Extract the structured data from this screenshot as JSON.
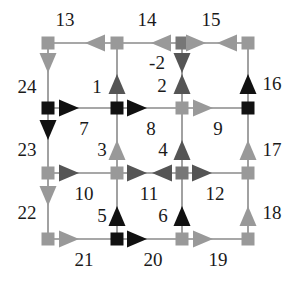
{
  "colors": {
    "background": "#ffffff",
    "edge_line": "#8a8a8a",
    "black": "#111111",
    "dark_gray": "#555555",
    "mid_gray": "#777777",
    "light_gray": "#999999",
    "label": "#1a1a1a"
  },
  "nodes": [
    {
      "id": "n00",
      "x": 48,
      "y": 43,
      "color": "light_gray"
    },
    {
      "id": "n10",
      "x": 117,
      "y": 43,
      "color": "light_gray"
    },
    {
      "id": "n20",
      "x": 182,
      "y": 43,
      "color": "mid_gray"
    },
    {
      "id": "n30",
      "x": 248,
      "y": 43,
      "color": "light_gray"
    },
    {
      "id": "n01",
      "x": 48,
      "y": 108,
      "color": "black"
    },
    {
      "id": "n11",
      "x": 117,
      "y": 108,
      "color": "black"
    },
    {
      "id": "n21",
      "x": 182,
      "y": 108,
      "color": "light_gray"
    },
    {
      "id": "n31",
      "x": 248,
      "y": 108,
      "color": "black"
    },
    {
      "id": "n02",
      "x": 48,
      "y": 173,
      "color": "light_gray"
    },
    {
      "id": "n12",
      "x": 117,
      "y": 173,
      "color": "light_gray"
    },
    {
      "id": "n22",
      "x": 182,
      "y": 173,
      "color": "mid_gray"
    },
    {
      "id": "n32",
      "x": 248,
      "y": 173,
      "color": "light_gray"
    },
    {
      "id": "n03",
      "x": 48,
      "y": 239,
      "color": "light_gray"
    },
    {
      "id": "n13",
      "x": 117,
      "y": 239,
      "color": "black"
    },
    {
      "id": "n23",
      "x": 182,
      "y": 239,
      "color": "light_gray"
    },
    {
      "id": "n33",
      "x": 248,
      "y": 239,
      "color": "light_gray"
    }
  ],
  "edges": [
    {
      "x1": 48,
      "y1": 43,
      "x2": 248,
      "y2": 43
    },
    {
      "x1": 48,
      "y1": 108,
      "x2": 248,
      "y2": 108
    },
    {
      "x1": 48,
      "y1": 173,
      "x2": 248,
      "y2": 173
    },
    {
      "x1": 48,
      "y1": 239,
      "x2": 248,
      "y2": 239
    },
    {
      "x1": 48,
      "y1": 43,
      "x2": 48,
      "y2": 239
    },
    {
      "x1": 117,
      "y1": 43,
      "x2": 117,
      "y2": 239
    },
    {
      "x1": 182,
      "y1": 43,
      "x2": 182,
      "y2": 239
    },
    {
      "x1": 248,
      "y1": 43,
      "x2": 248,
      "y2": 239
    }
  ],
  "arrows": [
    {
      "edge": "13",
      "x": 95,
      "y": 43,
      "dir": "left",
      "color": "light_gray"
    },
    {
      "edge": "14",
      "x": 161,
      "y": 43,
      "dir": "left",
      "color": "light_gray"
    },
    {
      "edge": "15a",
      "x": 196,
      "y": 43,
      "dir": "right",
      "color": "light_gray"
    },
    {
      "edge": "15b",
      "x": 227,
      "y": 43,
      "dir": "left",
      "color": "light_gray"
    },
    {
      "edge": "24",
      "x": 48,
      "y": 63,
      "dir": "down",
      "color": "light_gray"
    },
    {
      "edge": "1",
      "x": 117,
      "y": 84,
      "dir": "up",
      "color": "dark_gray"
    },
    {
      "edge": "-2",
      "x": 182,
      "y": 63,
      "dir": "down",
      "color": "dark_gray"
    },
    {
      "edge": "2",
      "x": 182,
      "y": 84,
      "dir": "up",
      "color": "dark_gray"
    },
    {
      "edge": "16",
      "x": 248,
      "y": 84,
      "dir": "up",
      "color": "black"
    },
    {
      "edge": "7",
      "x": 69,
      "y": 108,
      "dir": "right",
      "color": "black"
    },
    {
      "edge": "8",
      "x": 137,
      "y": 108,
      "dir": "right",
      "color": "black"
    },
    {
      "edge": "9",
      "x": 203,
      "y": 108,
      "dir": "right",
      "color": "light_gray"
    },
    {
      "edge": "23",
      "x": 48,
      "y": 130,
      "dir": "down",
      "color": "black"
    },
    {
      "edge": "3",
      "x": 117,
      "y": 150,
      "dir": "up",
      "color": "light_gray"
    },
    {
      "edge": "4",
      "x": 182,
      "y": 150,
      "dir": "up",
      "color": "dark_gray"
    },
    {
      "edge": "17",
      "x": 248,
      "y": 150,
      "dir": "up",
      "color": "light_gray"
    },
    {
      "edge": "10",
      "x": 69,
      "y": 173,
      "dir": "right",
      "color": "dark_gray"
    },
    {
      "edge": "11a",
      "x": 137,
      "y": 173,
      "dir": "right",
      "color": "dark_gray"
    },
    {
      "edge": "11b",
      "x": 162,
      "y": 173,
      "dir": "left",
      "color": "dark_gray"
    },
    {
      "edge": "12",
      "x": 202,
      "y": 173,
      "dir": "right",
      "color": "dark_gray"
    },
    {
      "edge": "22",
      "x": 48,
      "y": 196,
      "dir": "down",
      "color": "light_gray"
    },
    {
      "edge": "5",
      "x": 117,
      "y": 216,
      "dir": "up",
      "color": "black"
    },
    {
      "edge": "6",
      "x": 182,
      "y": 216,
      "dir": "up",
      "color": "black"
    },
    {
      "edge": "18",
      "x": 248,
      "y": 216,
      "dir": "up",
      "color": "light_gray"
    },
    {
      "edge": "21",
      "x": 69,
      "y": 239,
      "dir": "right",
      "color": "light_gray"
    },
    {
      "edge": "20",
      "x": 137,
      "y": 239,
      "dir": "right",
      "color": "black"
    },
    {
      "edge": "19",
      "x": 203,
      "y": 239,
      "dir": "right",
      "color": "light_gray"
    }
  ],
  "labels": [
    {
      "text": "13",
      "x": 65,
      "y": 26
    },
    {
      "text": "14",
      "x": 147,
      "y": 26
    },
    {
      "text": "15",
      "x": 211,
      "y": 26
    },
    {
      "text": "24",
      "x": 27,
      "y": 93
    },
    {
      "text": "1",
      "x": 97,
      "y": 93
    },
    {
      "text": "-2",
      "x": 157,
      "y": 69
    },
    {
      "text": "2",
      "x": 162,
      "y": 92
    },
    {
      "text": "16",
      "x": 272,
      "y": 90
    },
    {
      "text": "7",
      "x": 84,
      "y": 135
    },
    {
      "text": "8",
      "x": 151,
      "y": 135
    },
    {
      "text": "9",
      "x": 218,
      "y": 135
    },
    {
      "text": "23",
      "x": 27,
      "y": 156
    },
    {
      "text": "3",
      "x": 102,
      "y": 156
    },
    {
      "text": "4",
      "x": 163,
      "y": 156
    },
    {
      "text": "17",
      "x": 272,
      "y": 156
    },
    {
      "text": "10",
      "x": 84,
      "y": 200
    },
    {
      "text": "11",
      "x": 149,
      "y": 200
    },
    {
      "text": "12",
      "x": 215,
      "y": 200
    },
    {
      "text": "22",
      "x": 27,
      "y": 219
    },
    {
      "text": "5",
      "x": 102,
      "y": 222
    },
    {
      "text": "6",
      "x": 163,
      "y": 222
    },
    {
      "text": "18",
      "x": 272,
      "y": 219
    },
    {
      "text": "21",
      "x": 84,
      "y": 266
    },
    {
      "text": "20",
      "x": 153,
      "y": 266
    },
    {
      "text": "19",
      "x": 218,
      "y": 266
    }
  ]
}
